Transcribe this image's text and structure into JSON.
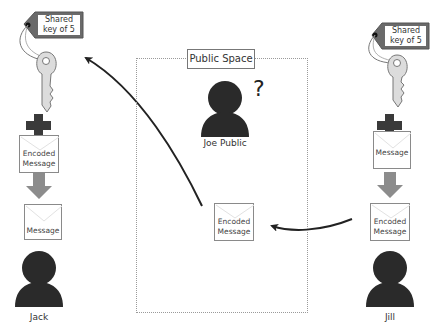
{
  "public_space": {
    "label": "Public Space",
    "unknown_marker": "?"
  },
  "actors": {
    "jack": {
      "name": "Jack"
    },
    "jill": {
      "name": "Jill"
    },
    "joe": {
      "name": "Joe Public"
    }
  },
  "left_column": {
    "key_tag": {
      "line1": "Shared",
      "line2": "key of 5"
    },
    "operator": "+",
    "encoded_envelope": {
      "line1": "Encoded",
      "line2": "Message"
    },
    "result_envelope": {
      "line1": "Message"
    }
  },
  "right_column": {
    "key_tag": {
      "line1": "Shared",
      "line2": "key of 5"
    },
    "operator": "+",
    "message_envelope": {
      "line1": "Message"
    },
    "result_envelope": {
      "line1": "Encoded",
      "line2": "Message"
    }
  },
  "public_envelope": {
    "line1": "Encoded",
    "line2": "Message"
  },
  "colors": {
    "silhouette": "#2a2a2a",
    "tag_border": "#5a5a5a",
    "key_fill": "#dcdcdc",
    "down_arrow": "#8c8c8c",
    "plus": "#3a3a3a",
    "arrow_line": "#222222"
  }
}
